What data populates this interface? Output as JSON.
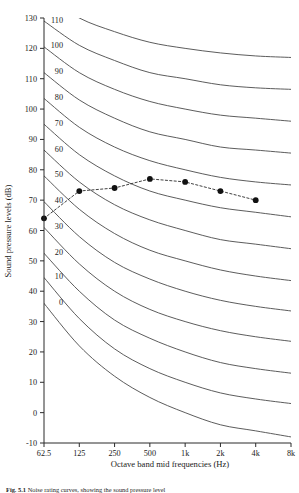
{
  "figure": {
    "caption_label": "Fig. 5.1",
    "caption_text": "Noise rating curves, showing the sound pressure level"
  },
  "chart_data": {
    "type": "line",
    "title": "",
    "xlabel": "Octave band mid frequencies (Hz)",
    "ylabel": "Sound pressure levels (dB)",
    "x_tick_labels": [
      "62.5",
      "125",
      "250",
      "500",
      "1k",
      "2k",
      "4k",
      "8k"
    ],
    "x_values_hz": [
      62.5,
      125,
      250,
      500,
      1000,
      2000,
      4000,
      8000
    ],
    "y_tick_labels": [
      "-10",
      "0",
      "10",
      "20",
      "30",
      "40",
      "50",
      "60",
      "70",
      "80",
      "90",
      "100",
      "110",
      "120",
      "130"
    ],
    "ylim": [
      -10,
      130
    ],
    "y_tick_step": 10,
    "grid": false,
    "legend_position": "none",
    "curve_labels": [
      "0",
      "10",
      "20",
      "30",
      "40",
      "50",
      "60",
      "70",
      "80",
      "90",
      "100",
      "110",
      "120"
    ],
    "nr_curves": [
      {
        "name": "NR 0",
        "values": [
          36.0,
          22.0,
          12.0,
          5.0,
          0.0,
          -4.0,
          -6.0,
          -8.0
        ]
      },
      {
        "name": "NR 10",
        "values": [
          44.5,
          31.0,
          21.0,
          14.5,
          10.0,
          6.5,
          4.5,
          3.0
        ]
      },
      {
        "name": "NR 20",
        "values": [
          52.5,
          40.0,
          30.5,
          24.5,
          20.0,
          16.5,
          14.5,
          13.0
        ]
      },
      {
        "name": "NR 30",
        "values": [
          61.0,
          49.0,
          40.0,
          34.0,
          30.0,
          27.0,
          25.0,
          23.5
        ]
      },
      {
        "name": "NR 40",
        "values": [
          69.5,
          58.0,
          49.5,
          44.0,
          40.0,
          37.0,
          35.0,
          33.5
        ]
      },
      {
        "name": "NR 50",
        "values": [
          78.0,
          67.0,
          59.0,
          53.5,
          50.0,
          47.0,
          45.0,
          43.5
        ]
      },
      {
        "name": "NR 60",
        "values": [
          86.5,
          76.0,
          68.5,
          63.5,
          60.0,
          57.0,
          55.5,
          54.0
        ]
      },
      {
        "name": "NR 70",
        "values": [
          95.0,
          85.0,
          78.0,
          73.0,
          70.0,
          67.5,
          66.0,
          64.5
        ]
      },
      {
        "name": "NR 80",
        "values": [
          103.5,
          94.0,
          87.5,
          83.0,
          80.0,
          77.5,
          76.0,
          75.0
        ]
      },
      {
        "name": "NR 90",
        "values": [
          112.0,
          103.0,
          97.0,
          92.5,
          90.0,
          87.5,
          86.5,
          85.5
        ]
      },
      {
        "name": "NR 100",
        "values": [
          120.5,
          112.0,
          106.5,
          102.5,
          100.0,
          98.0,
          97.0,
          96.0
        ]
      },
      {
        "name": "NR 110",
        "values": [
          129.0,
          121.0,
          116.0,
          112.0,
          110.0,
          108.0,
          107.0,
          106.5
        ]
      },
      {
        "name": "NR 120",
        "values": [
          137.5,
          130.0,
          125.5,
          122.0,
          120.0,
          118.5,
          117.5,
          117.0
        ]
      }
    ],
    "series": [
      {
        "name": "Measured spectrum",
        "marker": "filled-circle",
        "linestyle": "dashed",
        "categories": [
          "62.5",
          "125",
          "250",
          "500",
          "1k",
          "2k",
          "4k"
        ],
        "values": [
          64,
          73,
          74,
          77,
          76,
          73,
          70
        ]
      }
    ]
  }
}
